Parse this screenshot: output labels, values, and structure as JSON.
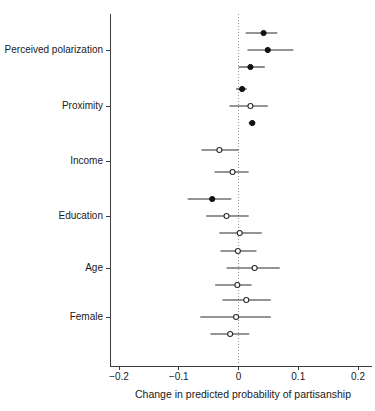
{
  "chart_data": {
    "type": "scatter",
    "subtype": "coefficient-dot-plot-with-confidence-intervals",
    "title": "",
    "xlabel": "Change in predicted probability of partisanship",
    "ylabel": "",
    "xlim": [
      -0.2,
      0.2
    ],
    "xticks": [
      -0.2,
      -0.1,
      0,
      0.1,
      0.2
    ],
    "xtick_labels": [
      "−0.2",
      "−0.1",
      "0",
      "0.1",
      "0.2"
    ],
    "grid": false,
    "legend": null,
    "reference_line": {
      "x": 0,
      "style": "dotted",
      "color": "#9a9a9a"
    },
    "categories": [
      "Perceived polarization",
      "Proximity",
      "Income",
      "Education",
      "Age",
      "Female"
    ],
    "marker_styles": {
      "filled": "significant",
      "open": "not-significant"
    },
    "points": [
      {
        "group": "Perceived polarization",
        "row": 1,
        "estimate": 0.042,
        "ci_low": 0.012,
        "ci_high": 0.065,
        "marker": "filled"
      },
      {
        "group": "Perceived polarization",
        "row": 2,
        "estimate": 0.049,
        "ci_low": 0.015,
        "ci_high": 0.092,
        "marker": "filled"
      },
      {
        "group": "Perceived polarization",
        "row": 3,
        "estimate": 0.02,
        "ci_low": 0.0,
        "ci_high": 0.044,
        "marker": "filled"
      },
      {
        "group": "Proximity",
        "row": 1,
        "estimate": 0.006,
        "ci_low": -0.004,
        "ci_high": 0.014,
        "marker": "filled"
      },
      {
        "group": "Proximity",
        "row": 2,
        "estimate": 0.02,
        "ci_low": -0.015,
        "ci_high": 0.049,
        "marker": "open"
      },
      {
        "group": "Proximity",
        "row": 3,
        "estimate": 0.023,
        "ci_low": 0.017,
        "ci_high": 0.028,
        "marker": "filled"
      },
      {
        "group": "Income",
        "row": 1,
        "estimate": -0.032,
        "ci_low": -0.062,
        "ci_high": 0.0,
        "marker": "open"
      },
      {
        "group": "Income",
        "row": 2,
        "estimate": -0.01,
        "ci_low": -0.04,
        "ci_high": 0.017,
        "marker": "open"
      },
      {
        "group": "Education",
        "row": 1,
        "estimate": -0.044,
        "ci_low": -0.085,
        "ci_high": -0.012,
        "marker": "filled"
      },
      {
        "group": "Education",
        "row": 2,
        "estimate": -0.02,
        "ci_low": -0.054,
        "ci_high": 0.017,
        "marker": "open"
      },
      {
        "group": "Education",
        "row": 3,
        "estimate": 0.002,
        "ci_low": -0.032,
        "ci_high": 0.039,
        "marker": "open"
      },
      {
        "group": "Age",
        "row": 1,
        "estimate": -0.001,
        "ci_low": -0.03,
        "ci_high": 0.03,
        "marker": "open"
      },
      {
        "group": "Age",
        "row": 2,
        "estimate": 0.027,
        "ci_low": -0.02,
        "ci_high": 0.069,
        "marker": "open"
      },
      {
        "group": "Age",
        "row": 3,
        "estimate": -0.002,
        "ci_low": -0.039,
        "ci_high": 0.022,
        "marker": "open"
      },
      {
        "group": "Female",
        "row": 1,
        "estimate": 0.013,
        "ci_low": -0.027,
        "ci_high": 0.054,
        "marker": "open"
      },
      {
        "group": "Female",
        "row": 2,
        "estimate": -0.004,
        "ci_low": -0.064,
        "ci_high": 0.054,
        "marker": "open"
      },
      {
        "group": "Female",
        "row": 3,
        "estimate": -0.014,
        "ci_low": -0.047,
        "ci_high": 0.018,
        "marker": "open"
      }
    ]
  }
}
